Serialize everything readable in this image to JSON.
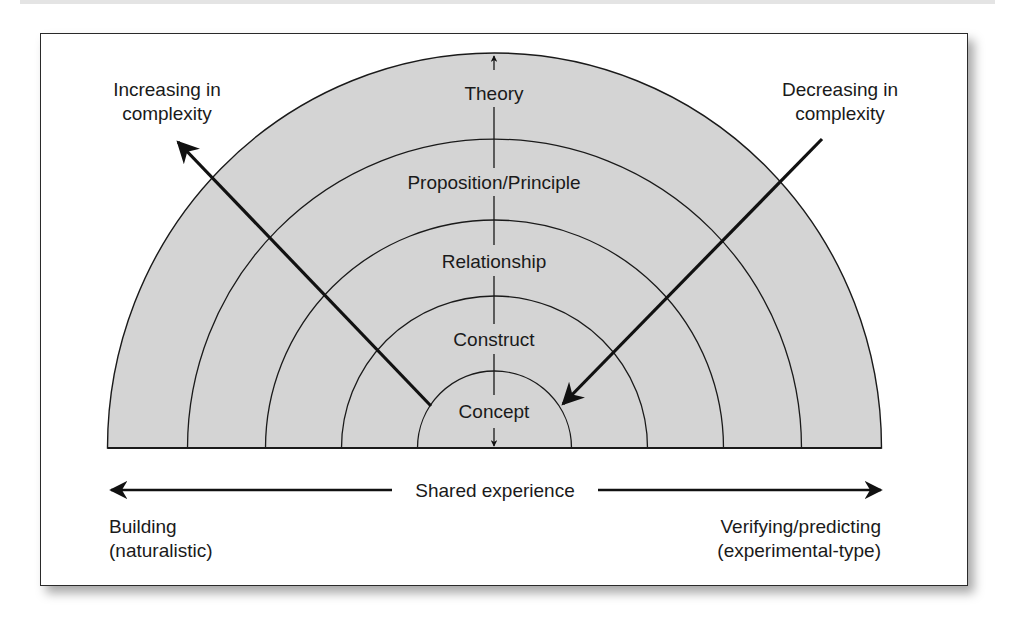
{
  "diagram": {
    "rings": [
      {
        "label": "Theory"
      },
      {
        "label": "Proposition/Principle"
      },
      {
        "label": "Relationship"
      },
      {
        "label": "Construct"
      },
      {
        "label": "Concept"
      }
    ],
    "left_annotation": {
      "line1": "Increasing in",
      "line2": "complexity"
    },
    "right_annotation": {
      "line1": "Decreasing in",
      "line2": "complexity"
    },
    "axis_label": "Shared experience",
    "bottom_left": {
      "line1": "Building",
      "line2": "(naturalistic)"
    },
    "bottom_right": {
      "line1": "Verifying/predicting",
      "line2": "(experimental-type)"
    },
    "colors": {
      "ring_fill": "#d4d4d4",
      "stroke": "#1a1a1a"
    }
  }
}
